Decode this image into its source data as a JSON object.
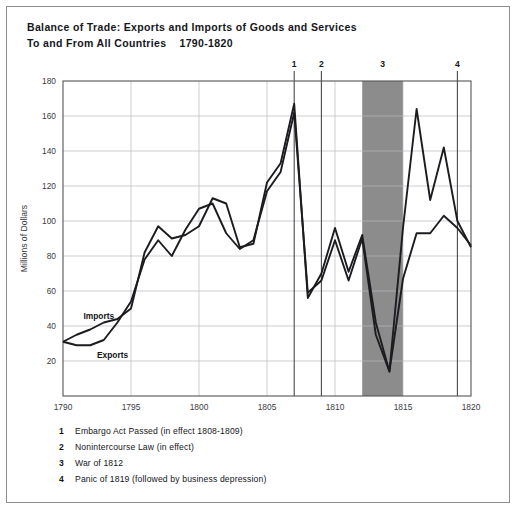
{
  "title": {
    "line1": "Balance of Trade: Exports and Imports of Goods and Services",
    "line2": "To and From All Countries    1790-1820"
  },
  "axis": {
    "ylabel": "Millions of Dollars",
    "yticks": [
      "0",
      "20",
      "40",
      "60",
      "80",
      "100",
      "120",
      "140",
      "160",
      "180"
    ],
    "xticks": [
      "1790",
      "1795",
      "1800",
      "1805",
      "1810",
      "1815",
      "1820"
    ]
  },
  "series_labels": {
    "imports": "Imports",
    "exports": "Exports"
  },
  "markers": [
    {
      "id": "1",
      "year": 1807
    },
    {
      "id": "2",
      "year": 1809
    },
    {
      "id": "3",
      "year": 1813
    },
    {
      "id": "4",
      "year": 1819
    }
  ],
  "notes": [
    {
      "num": "1",
      "text": "Embargo Act Passed (in effect 1808-1809)"
    },
    {
      "num": "2",
      "text": "Nonintercourse Law (in effect)"
    },
    {
      "num": "3",
      "text": "War of 1812"
    },
    {
      "num": "4",
      "text": "Panic of 1819 (followed by business depression)"
    }
  ],
  "colors": {
    "line": "#1c1c20",
    "grid": "#b9b9bd",
    "axis": "#555558",
    "band": "#8c8c8c",
    "text": "#15161a",
    "frame": "#8d8d8d"
  },
  "chart_data": {
    "type": "line",
    "title": "Balance of Trade: Exports and Imports of Goods and Services To and From All Countries 1790-1820",
    "xlabel": "",
    "ylabel": "Millions of Dollars",
    "xlim": [
      1790,
      1820
    ],
    "ylim": [
      0,
      180
    ],
    "grid": true,
    "legend_position": "inline-annotations",
    "x": [
      1790,
      1791,
      1792,
      1793,
      1794,
      1795,
      1796,
      1797,
      1798,
      1799,
      1800,
      1801,
      1802,
      1803,
      1804,
      1805,
      1806,
      1807,
      1808,
      1809,
      1810,
      1811,
      1812,
      1813,
      1814,
      1815,
      1816,
      1817,
      1818,
      1819,
      1820
    ],
    "series": [
      {
        "name": "Imports",
        "values": [
          31,
          35,
          38,
          42,
          44,
          50,
          82,
          97,
          90,
          92,
          97,
          113,
          110,
          85,
          87,
          122,
          133,
          167,
          56,
          70,
          96,
          71,
          92,
          42,
          14,
          96,
          164,
          112,
          142,
          100,
          85
        ]
      },
      {
        "name": "Exports",
        "values": [
          31,
          29,
          29,
          32,
          42,
          54,
          78,
          89,
          80,
          95,
          107,
          110,
          93,
          84,
          89,
          117,
          128,
          162,
          59,
          66,
          89,
          66,
          90,
          35,
          14,
          67,
          93,
          93,
          103,
          96,
          86
        ]
      }
    ],
    "shaded_region": {
      "label": "War of 1812",
      "x_start": 1812,
      "x_end": 1815
    },
    "vertical_markers": [
      {
        "label": "1",
        "x": 1807
      },
      {
        "label": "2",
        "x": 1809
      },
      {
        "label": "4",
        "x": 1819
      }
    ],
    "annotations": [
      {
        "text": "Imports",
        "x": 1791.5,
        "y": 44
      },
      {
        "text": "Exports",
        "x": 1792.5,
        "y": 22
      }
    ]
  }
}
